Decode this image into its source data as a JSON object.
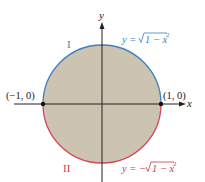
{
  "figure": {
    "axes": {
      "x_label": "x",
      "y_label": "y"
    },
    "points": {
      "left": "(−1, 0)",
      "right": "(1, 0)"
    },
    "regions": {
      "upper": "I",
      "lower": "II"
    },
    "equations": {
      "upper_lhs": "y = ",
      "upper_rad": "1 − x",
      "lower_lhs": "y = −",
      "lower_rad": "1 − x",
      "exp": "2"
    },
    "colors": {
      "fill": "#cdc3b1",
      "upper_arc": "#3f7fc0",
      "lower_arc": "#d0475a",
      "axis": "#222222",
      "label_upper": "#3f7fc0",
      "label_lower": "#c8394c"
    }
  }
}
